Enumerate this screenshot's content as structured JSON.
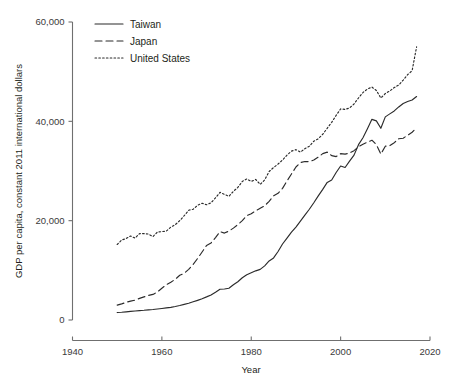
{
  "chart_data": {
    "type": "line",
    "title": "",
    "xlabel": "Year",
    "ylabel": "GDP per capita, constant 2011 international dollars",
    "xlim": [
      1940,
      2020
    ],
    "ylim": [
      0,
      60000
    ],
    "xticks": [
      "1940",
      "1960",
      "1980",
      "2000",
      "2020"
    ],
    "xtick_values": [
      1940,
      1960,
      1980,
      2000,
      2020
    ],
    "yticks": [
      "0",
      "20,000",
      "40,000",
      "60,000"
    ],
    "ytick_values": [
      0,
      20000,
      40000,
      60000
    ],
    "grid": false,
    "legend_position": "top-left-inside",
    "x": [
      1950,
      1951,
      1952,
      1953,
      1954,
      1955,
      1956,
      1957,
      1958,
      1959,
      1960,
      1961,
      1962,
      1963,
      1964,
      1965,
      1966,
      1967,
      1968,
      1969,
      1970,
      1971,
      1972,
      1973,
      1974,
      1975,
      1976,
      1977,
      1978,
      1979,
      1980,
      1981,
      1982,
      1983,
      1984,
      1985,
      1986,
      1987,
      1988,
      1989,
      1990,
      1991,
      1992,
      1993,
      1994,
      1995,
      1996,
      1997,
      1998,
      1999,
      2000,
      2001,
      2002,
      2003,
      2004,
      2005,
      2006,
      2007,
      2008,
      2009,
      2010,
      2011,
      2012,
      2013,
      2014,
      2015,
      2016,
      2017
    ],
    "series": [
      {
        "name": "Taiwan",
        "style": "solid",
        "color": "#2b2b2b",
        "values": [
          1500,
          1560,
          1650,
          1740,
          1820,
          1900,
          1960,
          2040,
          2120,
          2220,
          2320,
          2430,
          2550,
          2720,
          2920,
          3150,
          3380,
          3660,
          3960,
          4280,
          4650,
          5050,
          5600,
          6200,
          6250,
          6400,
          7100,
          7700,
          8500,
          9100,
          9500,
          9900,
          10200,
          10900,
          11900,
          12500,
          13800,
          15300,
          16500,
          17700,
          18700,
          19900,
          21100,
          22300,
          23600,
          25000,
          26300,
          27700,
          28200,
          29700,
          31000,
          30700,
          32000,
          33200,
          35300,
          36700,
          38500,
          40400,
          40100,
          38600,
          40900,
          41500,
          42100,
          42900,
          43600,
          44000,
          44300,
          45000
        ]
      },
      {
        "name": "Japan",
        "style": "dashed",
        "color": "#2b2b2b",
        "values": [
          3000,
          3250,
          3550,
          3800,
          4000,
          4350,
          4650,
          4950,
          5150,
          5650,
          6400,
          7100,
          7600,
          8200,
          9000,
          9400,
          10200,
          11200,
          12400,
          13700,
          15000,
          15500,
          16600,
          17800,
          17500,
          17900,
          18500,
          19200,
          20000,
          21000,
          21400,
          22000,
          22500,
          23000,
          23900,
          25000,
          25500,
          26500,
          28000,
          29400,
          30800,
          31700,
          31900,
          31900,
          32200,
          32800,
          33500,
          33800,
          33100,
          32900,
          33500,
          33400,
          33600,
          34100,
          34900,
          35400,
          35800,
          36200,
          35300,
          33400,
          35000,
          35100,
          35700,
          36500,
          36600,
          37200,
          37800,
          38700
        ]
      },
      {
        "name": "United States",
        "style": "dotted",
        "color": "#2b2b2b",
        "values": [
          15200,
          16100,
          16400,
          16900,
          16500,
          17400,
          17400,
          17300,
          16800,
          17700,
          17800,
          17900,
          18700,
          19200,
          20000,
          21000,
          22100,
          22300,
          23100,
          23500,
          23200,
          23600,
          24600,
          25700,
          25300,
          24900,
          25900,
          26700,
          27900,
          28400,
          27900,
          28300,
          27300,
          28200,
          29900,
          30700,
          31400,
          32200,
          33200,
          34000,
          34300,
          33800,
          34500,
          35000,
          36000,
          36500,
          37400,
          38600,
          39800,
          41200,
          42500,
          42400,
          42700,
          43500,
          44700,
          45800,
          46500,
          46900,
          46200,
          44700,
          45600,
          46100,
          46800,
          47300,
          48300,
          49400,
          50200,
          55000
        ]
      }
    ]
  },
  "legend": {
    "items": [
      {
        "label": "Taiwan",
        "style": "solid"
      },
      {
        "label": "Japan",
        "style": "dashed"
      },
      {
        "label": "United States",
        "style": "dotted"
      }
    ]
  },
  "axes": {
    "x_title": "Year",
    "y_title": "GDP per capita, constant 2011 international dollars"
  }
}
